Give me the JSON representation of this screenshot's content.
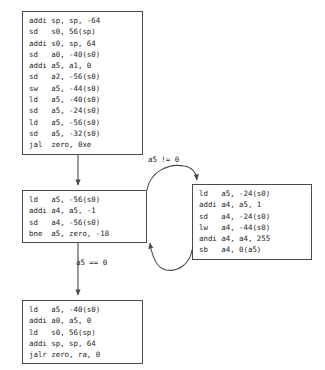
{
  "graph": {
    "title": "RISC-V control flow graph",
    "stroke_color": "#4a4a4a",
    "text_color": "#232323",
    "background": "#ffffff"
  },
  "blocks": {
    "entry": {
      "name": "entry-block",
      "lines": [
        "addi sp, sp, -64",
        "sd   s0, 56(sp)",
        "addi s0, sp, 64",
        "sd   a0, -40(s0)",
        "addi a5, a1, 0",
        "sd   a2, -56(s0)",
        "sw   a5, -44(s0)",
        "ld   a5, -40(s0)",
        "sd   a5, -24(s0)",
        "ld   a5, -56(s0)",
        "sd   a5, -32(s0)",
        "jal  zero, 0xe"
      ]
    },
    "loop_head": {
      "name": "loop-head-block",
      "lines": [
        "ld   a5, -56(s0)",
        "addi a4, a5, -1",
        "sd   a4, -56(s0)",
        "bne  a5, zero, -18"
      ]
    },
    "loop_body": {
      "name": "loop-body-block",
      "lines": [
        "ld   a5, -24(s0)",
        "addi a4, a5, 1",
        "sd   a4, -24(s0)",
        "lw   a4, -44(s0)",
        "andi a4, a4, 255",
        "sb   a4, 0(a5)"
      ]
    },
    "exit": {
      "name": "exit-block",
      "lines": [
        "ld   a5, -40(s0)",
        "addi a0, a5, 0",
        "ld   s0, 56(sp)",
        "addi sp, sp, 64",
        "jalr zero, ra, 0"
      ]
    }
  },
  "edges": {
    "entry_to_loop_head": {
      "label": ""
    },
    "loop_head_to_loop_body": {
      "label": "a5 != 0"
    },
    "loop_body_to_loop_head": {
      "label": ""
    },
    "loop_head_to_exit": {
      "label": "a5 == 0"
    }
  }
}
